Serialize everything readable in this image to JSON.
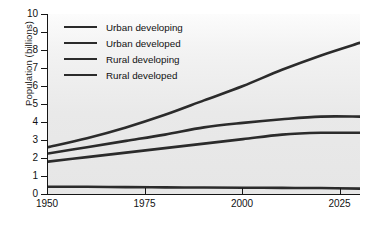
{
  "chart_data": {
    "type": "line",
    "title": "",
    "xlabel": "",
    "ylabel": "Population (billions)",
    "xlim": [
      1950,
      2030
    ],
    "ylim": [
      0,
      10
    ],
    "xticks": [
      1950,
      1975,
      2000,
      2025
    ],
    "yticks": [
      0,
      1,
      2,
      3,
      4,
      5,
      6,
      7,
      8,
      9,
      10
    ],
    "grid": false,
    "legend_position": "upper-left",
    "line_color": "#2b2b2b",
    "plot_background": "#e9e9e9",
    "x": [
      1950,
      1960,
      1970,
      1980,
      1990,
      2000,
      2010,
      2020,
      2030
    ],
    "series": [
      {
        "name": "Urban developing",
        "values": [
          2.6,
          3.1,
          3.7,
          4.4,
          5.2,
          6.0,
          6.9,
          7.7,
          8.4
        ]
      },
      {
        "name": "Urban developed",
        "values": [
          2.25,
          2.6,
          2.95,
          3.3,
          3.7,
          3.95,
          4.15,
          4.3,
          4.3
        ]
      },
      {
        "name": "Rural developing",
        "values": [
          1.8,
          2.05,
          2.3,
          2.55,
          2.8,
          3.05,
          3.3,
          3.4,
          3.4
        ]
      },
      {
        "name": "Rural developed",
        "values": [
          0.4,
          0.4,
          0.38,
          0.37,
          0.36,
          0.35,
          0.34,
          0.33,
          0.3
        ]
      }
    ]
  },
  "axis": {
    "ylabel": "Population (billions)",
    "ytick_labels": [
      "10",
      "9",
      "8",
      "7",
      "6",
      "5",
      "4",
      "3",
      "2",
      "1",
      "0"
    ],
    "xtick_labels": [
      "1950",
      "1975",
      "2000",
      "2025"
    ]
  },
  "legend": {
    "items": [
      {
        "label": "Urban developing"
      },
      {
        "label": "Urban developed"
      },
      {
        "label": "Rural developing"
      },
      {
        "label": "Rural developed"
      }
    ]
  }
}
